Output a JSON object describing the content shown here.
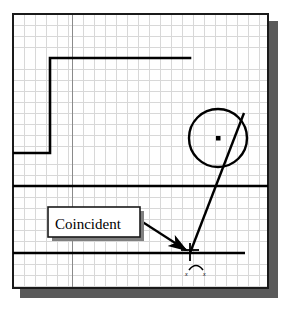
{
  "figure": {
    "kind": "cad-sketch-canvas",
    "background_color": "#ffffff",
    "canvas": {
      "border_color": "#1a1a1a",
      "fill_color": "#ffffff",
      "shadow_color": "#5a5a5a",
      "x": 13,
      "y": 14,
      "width": 255,
      "height": 274
    },
    "grid": {
      "minor_color": "#d8d8d8",
      "major_color": "#8a8a8a",
      "minor_spacing": 11,
      "major_vertical_x": 72,
      "visible": "true"
    },
    "geometry": {
      "line_color": "#000000",
      "step_polyline": {
        "name": "step-profile",
        "points": "13,153 50,153 50,58 190,58"
      },
      "horizontal_line_mid": {
        "name": "horizontal-line-mid",
        "x1": 13,
        "y1": 186,
        "x2": 268,
        "y2": 186
      },
      "horizontal_line_lower": {
        "name": "horizontal-line-lower",
        "x1": 13,
        "y1": 253,
        "x2": 245,
        "y2": 253
      },
      "circle": {
        "name": "circle",
        "cx": 218,
        "cy": 138,
        "r": 29
      },
      "circle_center_dot": {
        "name": "circle-center-point",
        "cx": 218,
        "cy": 138,
        "size": 4
      },
      "diagonal_line": {
        "name": "diagonal-line",
        "x1": 244,
        "y1": 113,
        "x2": 190,
        "y2": 253
      }
    },
    "annotation": {
      "callout": {
        "label": "Coincident",
        "x": 48,
        "y": 207,
        "width": 92,
        "height": 30,
        "fill_color": "#ffffff",
        "border_color": "#1a1a1a",
        "shadow_color": "#808080"
      },
      "leader_arrow": {
        "name": "leader-arrow",
        "from_x": 141,
        "from_y": 221,
        "to_x": 188,
        "to_y": 251,
        "color": "#000000"
      }
    },
    "cursor": {
      "crosshair": {
        "name": "crosshair-cursor",
        "cx": 190,
        "cy": 252,
        "arm": 9,
        "color": "#000000"
      },
      "constraint_glyph": {
        "name": "coincident-constraint-icon",
        "cx": 196,
        "cy": 268,
        "color": "#000000",
        "mark_left": "x",
        "mark_right": "x"
      }
    }
  }
}
